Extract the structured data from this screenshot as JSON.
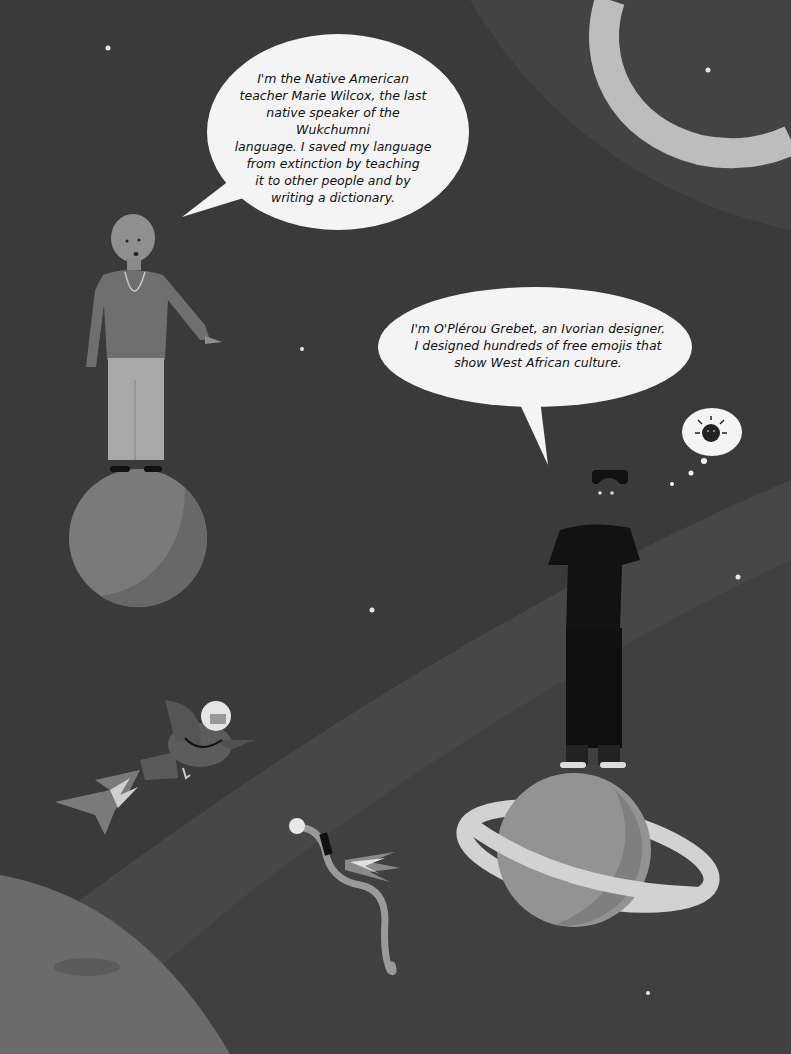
{
  "scene": {
    "background_color": "#3d3d3d",
    "band_color": "#4a4a4a"
  },
  "characters": [
    {
      "id": "marie-wilcox",
      "name": "Marie Wilcox",
      "speech": {
        "lines": [
          "I'm the Native American",
          "teacher Marie Wilcox, the last",
          "native speaker of the Wukchumni",
          "language. I saved my language",
          "from extinction by teaching",
          "it to other people and by",
          "writing a dictionary."
        ]
      }
    },
    {
      "id": "o-plerou-grebet",
      "name": "O'Plérou Grebet",
      "speech": {
        "lines": [
          "I'm O'Plérou Grebet, an Ivorian designer.",
          "I designed hundreds of free emojis that",
          "show West African culture."
        ]
      },
      "thought": {
        "icon": "virus-emoji-icon"
      }
    }
  ],
  "elements": {
    "planet_left": "grey planet",
    "planet_ringed": "ringed planet",
    "bird": "bird with helmet and rocket jets",
    "worm": "worm with flashlight and rocket",
    "large_planet_corner": "large textured planet",
    "crescent_ring": "crescent arc top right"
  }
}
